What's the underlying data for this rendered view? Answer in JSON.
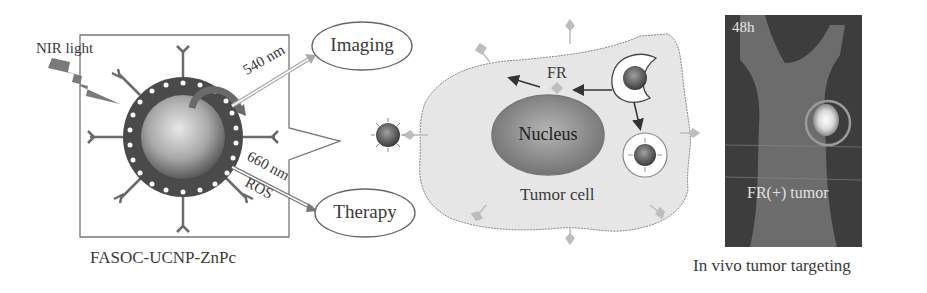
{
  "panel_left": {
    "light_label": "NIR  light",
    "emission_top": "540 nm",
    "emission_bottom": "660 nm",
    "ros_label": "ROS",
    "caption": "FASOC-UCNP-ZnPc"
  },
  "outputs": {
    "imaging": "Imaging",
    "therapy": "Therapy"
  },
  "cell": {
    "receptor_label": "FR",
    "nucleus_label": "Nucleus",
    "cell_label": "Tumor cell"
  },
  "photo": {
    "time_label": "48h",
    "tumor_label": "FR(+) tumor",
    "caption": "In vivo tumor targeting"
  },
  "colors": {
    "shell": "#4a4a4a",
    "core": "#9a9a9a",
    "cell_fill": "#e4e4e4",
    "nucleus": "#8a8a8a",
    "photo_bg": "#3d3d3d",
    "receptor": "#b8b8b8"
  }
}
